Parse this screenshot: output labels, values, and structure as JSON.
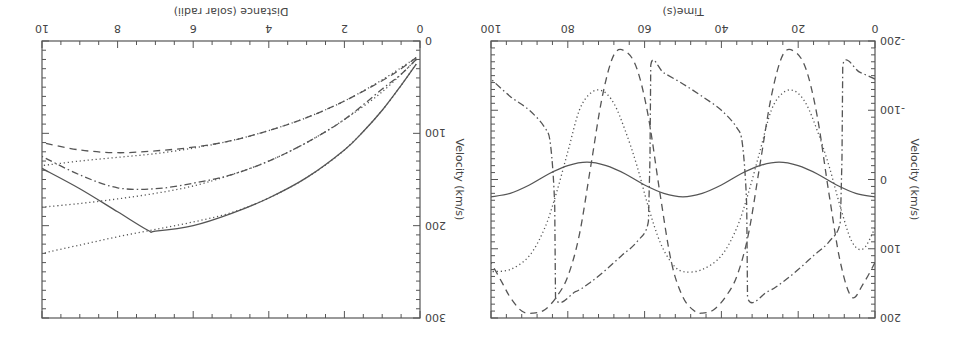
{
  "chart_data": [
    {
      "id": "time_panel",
      "type": "line",
      "title": "",
      "xlabel": "Time(s)",
      "ylabel": "Velocity (km/s)",
      "xlim": [
        0,
        100
      ],
      "ylim": [
        -200,
        200
      ],
      "xticks": [
        0,
        20,
        40,
        60,
        80,
        100
      ],
      "yticks": [
        -200,
        -100,
        0,
        100,
        200
      ],
      "xtick_labels": [
        "0",
        "20",
        "40",
        "60",
        "80",
        "100"
      ],
      "ytick_labels": [
        "-200",
        "-100",
        "0",
        "100",
        "200"
      ],
      "grid": false,
      "rotation_deg": 180,
      "series": [
        {
          "name": "solid",
          "style": "solid",
          "x": [
            0,
            5,
            10,
            15,
            20,
            25,
            30,
            35,
            40,
            45,
            50,
            55,
            60,
            65,
            70,
            75,
            80,
            85,
            90,
            95,
            100
          ],
          "values": [
            25,
            20,
            8,
            -8,
            -20,
            -25,
            -20,
            -8,
            8,
            20,
            25,
            20,
            8,
            -8,
            -20,
            -25,
            -20,
            -8,
            8,
            20,
            25
          ]
        },
        {
          "name": "dashed",
          "style": "dashed",
          "x": [
            0,
            3,
            6,
            9,
            12,
            15,
            18,
            21,
            24,
            27,
            30,
            33,
            36,
            39,
            42,
            45,
            47,
            50,
            53,
            56,
            59,
            62,
            65,
            68,
            71,
            74,
            77,
            80,
            83,
            86,
            89,
            92,
            95,
            97,
            100
          ],
          "values": [
            120,
            150,
            170,
            120,
            20,
            -90,
            -160,
            -185,
            -180,
            -120,
            -20,
            80,
            140,
            170,
            188,
            193,
            190,
            170,
            120,
            20,
            -90,
            -160,
            -185,
            -180,
            -120,
            -20,
            80,
            140,
            170,
            188,
            193,
            190,
            170,
            150,
            120
          ]
        },
        {
          "name": "dotted",
          "style": "dotted",
          "x": [
            0,
            3,
            6,
            9,
            12,
            15,
            18,
            21,
            24,
            27,
            30,
            33,
            36,
            40,
            45,
            50,
            53,
            56,
            59,
            62,
            65,
            68,
            71,
            74,
            77,
            80,
            83,
            86,
            90,
            95,
            100
          ],
          "values": [
            70,
            100,
            90,
            40,
            -20,
            -70,
            -110,
            -128,
            -125,
            -100,
            -40,
            20,
            70,
            110,
            130,
            133,
            120,
            90,
            40,
            -20,
            -70,
            -110,
            -128,
            -125,
            -100,
            -40,
            20,
            70,
            110,
            130,
            133
          ]
        },
        {
          "name": "dash-dot",
          "style": "dashdot",
          "x": [
            0,
            4,
            8.4,
            8.6,
            9,
            12,
            16,
            20,
            24,
            28,
            33.2,
            33.4,
            34.5,
            36,
            40,
            45,
            50,
            55,
            58.4,
            58.6,
            59,
            62,
            66,
            70,
            74,
            78,
            83.2,
            83.4,
            84.5,
            86,
            90,
            95,
            100
          ],
          "values": [
            -145,
            -155,
            -165,
            -30,
            60,
            90,
            110,
            130,
            148,
            162,
            170,
            40,
            -50,
            -75,
            -100,
            -120,
            -138,
            -154,
            -165,
            -30,
            60,
            90,
            110,
            130,
            148,
            162,
            170,
            40,
            -50,
            -75,
            -100,
            -120,
            -145
          ]
        }
      ]
    },
    {
      "id": "distance_panel",
      "type": "line",
      "title": "",
      "xlabel": "Distance (solar radii)",
      "ylabel": "Velocity (km/s)",
      "xlim": [
        0,
        10
      ],
      "ylim": [
        0,
        300
      ],
      "xticks": [
        0,
        2,
        4,
        6,
        8,
        10
      ],
      "yticks": [
        0,
        100,
        200,
        300
      ],
      "xtick_labels": [
        "0",
        "2",
        "4",
        "6",
        "8",
        "10"
      ],
      "ytick_labels": [
        "0",
        "100",
        "200",
        "300"
      ],
      "grid": false,
      "rotation_deg": 180,
      "series": [
        {
          "name": "solid",
          "style": "solid",
          "x": [
            0.1,
            0.5,
            1,
            1.5,
            2,
            3,
            4,
            5,
            6,
            7,
            7.2,
            8,
            9,
            10
          ],
          "values": [
            25,
            48,
            75,
            98,
            118,
            148,
            170,
            187,
            200,
            206,
            205,
            185,
            160,
            138
          ]
        },
        {
          "name": "dashed",
          "style": "dashed",
          "x": [
            0.1,
            0.5,
            1,
            2,
            3,
            4,
            5,
            6,
            7,
            8,
            9,
            10
          ],
          "values": [
            18,
            30,
            43,
            65,
            83,
            97,
            108,
            115,
            119,
            121,
            118,
            110
          ]
        },
        {
          "name": "dash-dot",
          "style": "dashdot",
          "x": [
            0.1,
            0.5,
            1,
            2,
            3,
            4,
            5,
            6,
            7,
            8,
            9,
            10
          ],
          "values": [
            20,
            36,
            52,
            85,
            110,
            130,
            145,
            154,
            160,
            159,
            145,
            125
          ]
        },
        {
          "name": "dotted-1",
          "style": "dotted",
          "x": [
            0.1,
            1,
            2,
            3,
            4,
            5,
            6,
            7,
            8,
            9,
            10
          ],
          "values": [
            25,
            75,
            118,
            148,
            170,
            186,
            196,
            204,
            212,
            221,
            230
          ]
        },
        {
          "name": "dotted-2",
          "style": "dotted",
          "x": [
            0.1,
            1,
            2,
            3,
            4,
            5,
            6,
            7,
            8,
            9,
            10
          ],
          "values": [
            20,
            55,
            85,
            110,
            130,
            145,
            157,
            165,
            171,
            176,
            180
          ]
        },
        {
          "name": "dotted-3",
          "style": "dotted",
          "x": [
            0.1,
            1,
            2,
            3,
            4,
            5,
            6,
            7,
            8,
            9,
            10
          ],
          "values": [
            18,
            42,
            65,
            83,
            97,
            108,
            116,
            122,
            126,
            130,
            135
          ]
        }
      ]
    }
  ]
}
